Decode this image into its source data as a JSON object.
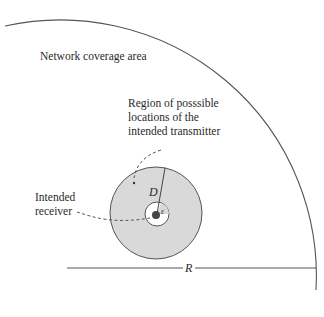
{
  "diagram": {
    "labels": {
      "coverage_area": "Network coverage area",
      "region_line1": "Region of posssible",
      "region_line2": "locations of the",
      "region_line3": "intended transmitter",
      "receiver_line1": "Intended",
      "receiver_line2": "receiver",
      "radius_D": "D",
      "radius_epsilon": "ε",
      "radius_R": "R"
    },
    "colors": {
      "stroke": "#555555",
      "region_fill": "#d9d9d9",
      "inner_fill": "#ffffff",
      "receiver_dot": "#444444",
      "background": "#ffffff"
    },
    "geometry": {
      "coverage_center": [
        60,
        268
      ],
      "coverage_radius": 256,
      "region_center": [
        156,
        213
      ],
      "region_radius": 46,
      "exclusion_radius": 12,
      "receiver_dot_radius": 4
    }
  }
}
